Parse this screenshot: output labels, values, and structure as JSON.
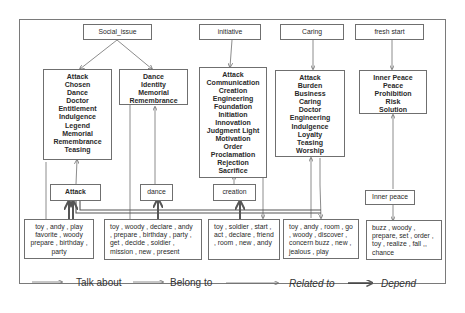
{
  "topics": [
    {
      "id": "social_issue",
      "label": "Social_issue"
    },
    {
      "id": "initiative",
      "label": "initiative"
    },
    {
      "id": "caring",
      "label": "Caring"
    },
    {
      "id": "fresh_start",
      "label": "fresh start"
    }
  ],
  "concept_lists": {
    "social_issue_a": [
      "Attack",
      "Chosen",
      "Dance",
      "Doctor",
      "Entitlement",
      "Indulgence",
      "Legend",
      "Memorial",
      "Remembrance",
      "Teasing"
    ],
    "social_issue_b": [
      "Dance",
      "Identity",
      "Memorial",
      "Remembrance"
    ],
    "initiative": [
      "Attack",
      "Communication",
      "Creation",
      "Engineering",
      "Foundation",
      "Initiation",
      "Innovation",
      "Judgment Light",
      "Motivation",
      "Order",
      "Proclamation",
      "Rejection",
      "Sacrifice"
    ],
    "caring": [
      "Attack",
      "Burden",
      "Business",
      "Caring",
      "Doctor",
      "Engineering",
      "Indulgence",
      "Loyalty",
      "Teasing",
      "Worship"
    ],
    "fresh_start": [
      "Inner Peace",
      "Peace",
      "Prohibition",
      "Risk",
      "Solution"
    ]
  },
  "concepts": {
    "attack": "Attack",
    "dance": "dance",
    "creation": "creation",
    "inner_peace": "Inner peace"
  },
  "word_groups": {
    "g1": "toy , andy , play favorite , woody prepare , birthday , party",
    "g2": "toy , woody , declare , andy , prepare , birthday , party , get , decide , soldier , mission , new , present",
    "g3": "toy , soldier , start , act , declare , friend , room , new , andy",
    "g4": "toy , andy , room , go , woody , discover , concern buzz , new , jealous , play",
    "g5": "buzz , woody , prepare, set , order , toy , realize , fall ,, chance"
  },
  "legend": [
    {
      "label": "Talk about",
      "style": "thin"
    },
    {
      "label": "Belong to",
      "style": "thin"
    },
    {
      "label": "Related to",
      "style": "thin-italic"
    },
    {
      "label": "Depend",
      "style": "bold-italic"
    }
  ],
  "colors": {
    "line": "#6f6f6f",
    "line_thick": "#555555",
    "border": "#7a7a7a",
    "text": "#2a2a2a"
  }
}
